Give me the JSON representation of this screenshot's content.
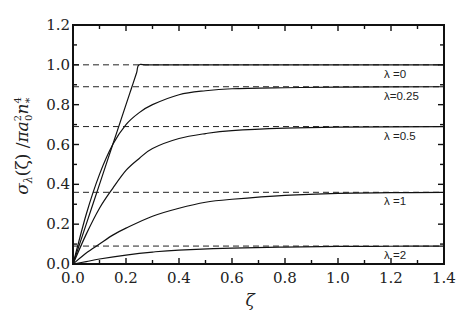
{
  "chart_data": {
    "type": "line",
    "title": "",
    "xlabel": "ζ",
    "ylabel_parts": {
      "sigma": "σ",
      "sub_lambda": "λ",
      "arg": "(ζ)",
      "slash": " /",
      "pi_a": "πa",
      "sub_0": "0",
      "sup_2": "2",
      "n": "n",
      "sup_4": "4",
      "sub_star": "*"
    },
    "xlim": [
      0,
      1.4
    ],
    "ylim": [
      0,
      1.2
    ],
    "xticks": [
      "0.0",
      "0.2",
      "0.4",
      "0.6",
      "0.8",
      "1.0",
      "1.2",
      "1.4"
    ],
    "xtick_values": [
      0,
      0.2,
      0.4,
      0.6,
      0.8,
      1.0,
      1.2,
      1.4
    ],
    "yticks": [
      "0.0",
      "0.2",
      "0.4",
      "0.6",
      "0.8",
      "1.0",
      "1.2"
    ],
    "ytick_values": [
      0,
      0.2,
      0.4,
      0.6,
      0.8,
      1.0,
      1.2
    ],
    "minor_tick_step": 0.1,
    "grid": false,
    "series": [
      {
        "name": "λ=0",
        "label": "λ =0",
        "asymptote": 1.0,
        "x": [
          0,
          0.05,
          0.1,
          0.15,
          0.2,
          0.22,
          0.24,
          0.25,
          0.3,
          0.6,
          1.0,
          1.4
        ],
        "y": [
          0,
          0.2,
          0.4,
          0.6,
          0.8,
          0.88,
          0.96,
          1.0,
          1.0,
          1.0,
          1.0,
          1.0
        ]
      },
      {
        "name": "λ=0.25",
        "label": "λ=0.25",
        "asymptote": 0.89,
        "x": [
          0,
          0.05,
          0.1,
          0.15,
          0.2,
          0.25,
          0.3,
          0.4,
          0.5,
          0.6,
          0.8,
          1.0,
          1.4
        ],
        "y": [
          0,
          0.25,
          0.45,
          0.6,
          0.7,
          0.76,
          0.8,
          0.85,
          0.87,
          0.88,
          0.885,
          0.888,
          0.89
        ]
      },
      {
        "name": "λ=0.5",
        "label": "λ  =0.5",
        "asymptote": 0.69,
        "x": [
          0,
          0.05,
          0.1,
          0.15,
          0.2,
          0.25,
          0.3,
          0.4,
          0.5,
          0.6,
          0.8,
          1.0,
          1.4
        ],
        "y": [
          0,
          0.15,
          0.28,
          0.38,
          0.47,
          0.53,
          0.58,
          0.63,
          0.655,
          0.67,
          0.682,
          0.687,
          0.69
        ]
      },
      {
        "name": "λ=1",
        "label": "λ =1",
        "asymptote": 0.36,
        "x": [
          0,
          0.05,
          0.1,
          0.15,
          0.2,
          0.3,
          0.4,
          0.5,
          0.6,
          0.8,
          1.0,
          1.2,
          1.4
        ],
        "y": [
          0,
          0.055,
          0.1,
          0.145,
          0.18,
          0.24,
          0.28,
          0.31,
          0.325,
          0.345,
          0.355,
          0.358,
          0.36
        ]
      },
      {
        "name": "λ=2",
        "label": "λ =2",
        "asymptote": 0.09,
        "x": [
          0,
          0.05,
          0.1,
          0.2,
          0.3,
          0.4,
          0.6,
          0.8,
          1.0,
          1.2,
          1.4
        ],
        "y": [
          0,
          0.012,
          0.025,
          0.045,
          0.06,
          0.07,
          0.08,
          0.085,
          0.088,
          0.089,
          0.09
        ]
      }
    ],
    "legend": "inline-right"
  }
}
